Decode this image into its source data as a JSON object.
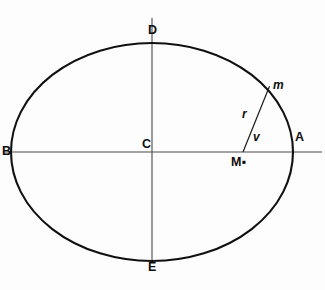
{
  "figure": {
    "background_color": "#fdfdfd",
    "stroke_color": "#111111",
    "axis_color": "#4a4a4a",
    "caption": ""
  },
  "geometry": {
    "center": {
      "x": 152,
      "y": 152
    },
    "semi_major_axis": 141,
    "semi_minor_axis": 109,
    "focus": {
      "x": 243,
      "y": 152
    },
    "body_point": {
      "x": 268,
      "y": 90
    },
    "horizontal_axis": {
      "x1": 4,
      "y1": 152,
      "x2": 322,
      "y2": 152
    },
    "vertical_axis": {
      "x1": 152,
      "y1": 18,
      "x2": 152,
      "y2": 262
    }
  },
  "labels": {
    "vertex_right": "A",
    "vertex_left": "B",
    "center": "C",
    "vertex_top": "D",
    "vertex_bottom": "E",
    "orbiting_body": "m",
    "radius_vector": "r",
    "true_anomaly": "v",
    "focus_mass": "M",
    "focus_mass_subscript": "▪"
  }
}
